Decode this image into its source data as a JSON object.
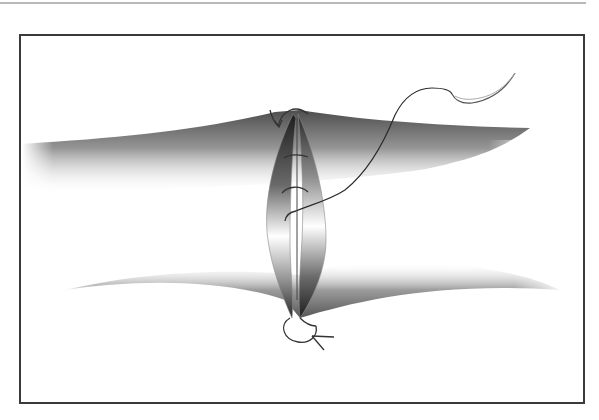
{
  "figure": {
    "colors": {
      "background": "#ffffff",
      "frame": "#3a3a3a",
      "top_rule": "#b8b8b8",
      "tissue_dark": "#2a2a2a",
      "tissue_mid": "#8a8a8a",
      "thread": "#2b2b2b",
      "needle": "#555555"
    },
    "elements": [
      "upper-tissue-flap",
      "lower-tissue-flap",
      "wound-edge-left",
      "wound-edge-right",
      "interrupted-stitches",
      "suture-thread",
      "curved-needle",
      "top-knot-loop",
      "bottom-knot-loop"
    ]
  }
}
